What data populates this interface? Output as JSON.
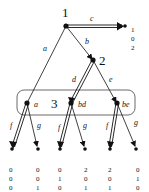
{
  "diagram": {
    "type": "game-tree",
    "players": {
      "p1": "1",
      "p2": "2",
      "p3": "3"
    },
    "edges": {
      "a": "a",
      "b": "b",
      "c": "c",
      "d": "d",
      "e": "e",
      "f1": "f",
      "g1": "g",
      "f2": "f",
      "g2": "g",
      "f3": "f",
      "g3": "g"
    },
    "infoset_nodes": {
      "n_a": "a",
      "n_bd": "bd",
      "n_be": "be"
    },
    "payoffs": {
      "c": [
        "1",
        "0",
        "2"
      ],
      "af": [
        "0",
        "0",
        "0"
      ],
      "ag": [
        "0",
        "0",
        "1"
      ],
      "bdf": [
        "0",
        "1",
        "0"
      ],
      "bdg": [
        "2",
        "0",
        "1"
      ],
      "bef": [
        "2",
        "0",
        "1"
      ],
      "beg": [
        "0",
        "1",
        "0"
      ]
    }
  }
}
